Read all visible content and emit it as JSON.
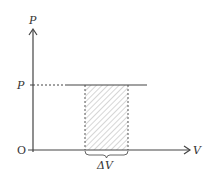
{
  "diagram": {
    "type": "pressure-volume graph",
    "axes": {
      "y_label": "P",
      "x_label": "V",
      "origin_label": "O"
    },
    "level_label": "P",
    "width_label": "ΔV",
    "shaded_region": "work done = PΔV (hatched rectangle)",
    "colors": {
      "line": "#444444",
      "hatch": "#888888"
    }
  }
}
